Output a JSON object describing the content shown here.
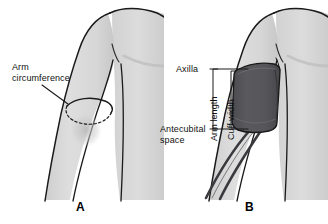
{
  "figure": {
    "background_color": "#ffffff"
  },
  "colors": {
    "skin_fill": "#d9d9d9",
    "skin_fill_light": "#e4e4e4",
    "skin_shadow": "#c6c6c6",
    "outline": "#1a1a1a",
    "cuff_fill": "#545458",
    "cuff_outline": "#1a1a1a",
    "tube_fill": "#3a3a3e",
    "text": "#101010",
    "leader_line": "#1a1a1a"
  },
  "panels": [
    {
      "id": "a",
      "letter": "A",
      "name": "arm-circumference-panel",
      "labels": [
        {
          "id": "arm-circumference",
          "name": "arm-circumference-label",
          "lines": [
            "Arm",
            "circumference"
          ],
          "text": "Arm\ncircumference"
        }
      ],
      "annotations": [
        {
          "id": "circumference-ring",
          "name": "arm-circumference-ring",
          "description": "ring around upper arm, solid upper arc and dashed lower arc"
        }
      ]
    },
    {
      "id": "b",
      "letter": "B",
      "name": "cuff-placement-panel",
      "labels": [
        {
          "id": "axilla",
          "name": "axilla-label",
          "text": "Axilla"
        },
        {
          "id": "antecubital-space",
          "name": "antecubital-space-label",
          "lines": [
            "Antecubital",
            "space"
          ],
          "text": "Antecubital\nspace"
        },
        {
          "id": "arm-length",
          "name": "arm-length-label",
          "text": "Arm length",
          "orientation": "vertical"
        },
        {
          "id": "cuff-width",
          "name": "cuff-width-label",
          "text": "Cuff width",
          "orientation": "vertical"
        }
      ],
      "annotations": [
        {
          "id": "cuff",
          "name": "blood-pressure-cuff",
          "description": "dark gray inflatable cuff wrapped around upper arm"
        },
        {
          "id": "tubing",
          "name": "cuff-tubing",
          "description": "two tubes descending from lower edge of cuff"
        }
      ]
    }
  ]
}
